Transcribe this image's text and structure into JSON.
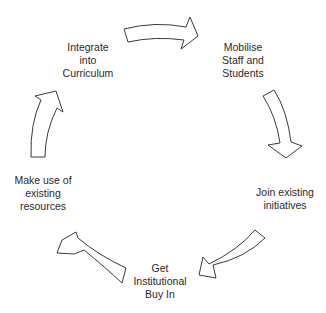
{
  "diagram": {
    "type": "cycle",
    "title": "",
    "colors": {
      "stroke": "#3a3a3a",
      "fill": "#ffffff",
      "text": "#2a2a2a",
      "background": "#ffffff"
    },
    "nodes": [
      {
        "id": "mobilise",
        "lines": [
          "Mobilise",
          "Staff and",
          "Students"
        ]
      },
      {
        "id": "join",
        "lines": [
          "Join existing",
          "initiatives"
        ]
      },
      {
        "id": "buyin",
        "lines": [
          "Get",
          "Institutional",
          "Buy In"
        ]
      },
      {
        "id": "resources",
        "lines": [
          "Make use of",
          "existing",
          "resources"
        ]
      },
      {
        "id": "integrate",
        "lines": [
          "Integrate",
          "into",
          "Curriculum"
        ]
      }
    ],
    "edges": [
      {
        "from": "integrate",
        "to": "mobilise",
        "icon": "curved-arrow-right"
      },
      {
        "from": "mobilise",
        "to": "join",
        "icon": "curved-arrow-down"
      },
      {
        "from": "join",
        "to": "buyin",
        "icon": "curved-arrow-down-left"
      },
      {
        "from": "buyin",
        "to": "resources",
        "icon": "curved-arrow-up-left"
      },
      {
        "from": "resources",
        "to": "integrate",
        "icon": "curved-arrow-up"
      }
    ]
  }
}
